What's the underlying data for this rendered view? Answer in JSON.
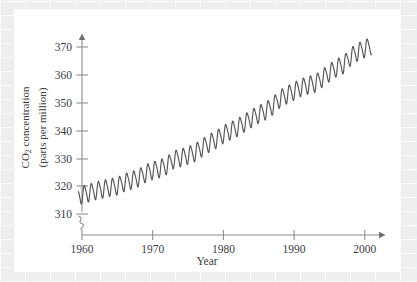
{
  "figure": {
    "background_color": "#ffffff",
    "page_background_color": "#efefef",
    "line_color": "#555558",
    "axis_color": "#8d8d93",
    "text_color": "#3b3b42"
  },
  "axes": {
    "x_title": "Year",
    "y_title_line1": "CO",
    "y_title_sub": "2",
    "y_title_line1_rest": " concentration",
    "y_title_line2": "(parts per million)",
    "x_ticks": [
      "1960",
      "1970",
      "1980",
      "1990",
      "2000"
    ],
    "y_ticks": [
      "310",
      "320",
      "330",
      "340",
      "350",
      "360",
      "370"
    ],
    "axis_break_symbol": "axis-break-squiggle"
  },
  "chart_data": {
    "type": "line",
    "title": "",
    "xlabel": "Year",
    "ylabel": "CO2 concentration (parts per million)",
    "xlim": [
      1958.5,
      2001.5
    ],
    "ylim": [
      310,
      374
    ],
    "grid": false,
    "legend": null,
    "y_axis_break_below": 310,
    "series_name": "Atmospheric CO2 (Mauna Loa, monthly mean)",
    "seasonal_cycle_peak_to_peak_ppm": 6.0,
    "seasonal_peak_month": "May",
    "seasonal_trough_month": "September",
    "annual_means": {
      "x": [
        1959,
        1960,
        1961,
        1962,
        1963,
        1964,
        1965,
        1966,
        1967,
        1968,
        1969,
        1970,
        1971,
        1972,
        1973,
        1974,
        1975,
        1976,
        1977,
        1978,
        1979,
        1980,
        1981,
        1982,
        1983,
        1984,
        1985,
        1986,
        1987,
        1988,
        1989,
        1990,
        1991,
        1992,
        1993,
        1994,
        1995,
        1996,
        1997,
        1998,
        1999,
        2000
      ],
      "y": [
        315.98,
        316.91,
        317.64,
        318.45,
        318.99,
        319.62,
        320.04,
        321.38,
        322.16,
        323.04,
        324.62,
        325.68,
        326.32,
        327.45,
        329.68,
        330.25,
        331.15,
        332.15,
        333.9,
        335.5,
        336.85,
        338.69,
        339.93,
        341.13,
        342.78,
        344.42,
        345.9,
        347.15,
        348.93,
        351.48,
        352.91,
        354.19,
        355.59,
        356.37,
        357.04,
        358.89,
        360.88,
        362.64,
        363.76,
        366.63,
        368.31,
        369.48
      ]
    },
    "notable_points": [
      {
        "label": "start 1960",
        "x": 1960,
        "y": 325.0
      },
      {
        "label": "end 2000",
        "x": 2000,
        "y": 369.5
      }
    ]
  }
}
